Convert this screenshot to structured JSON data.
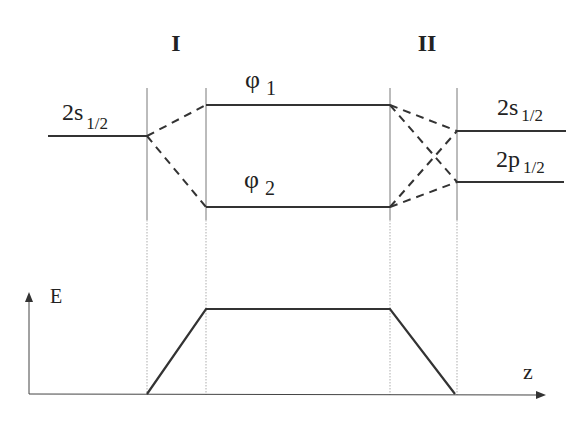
{
  "regions": {
    "region_I": "I",
    "region_II": "II"
  },
  "levels": {
    "left_2s": {
      "main": "2s",
      "sub": "1/2"
    },
    "phi1": {
      "main": "φ",
      "sub": "1"
    },
    "phi2": {
      "main": "φ",
      "sub": "2"
    },
    "right_2s": {
      "main": "2s",
      "sub": "1/2"
    },
    "right_2p": {
      "main": "2p",
      "sub": "1/2"
    }
  },
  "axes": {
    "y_label": "E",
    "x_label": "z"
  },
  "colors": {
    "line": "#333333",
    "guide": "#555555",
    "background": "#ffffff"
  }
}
